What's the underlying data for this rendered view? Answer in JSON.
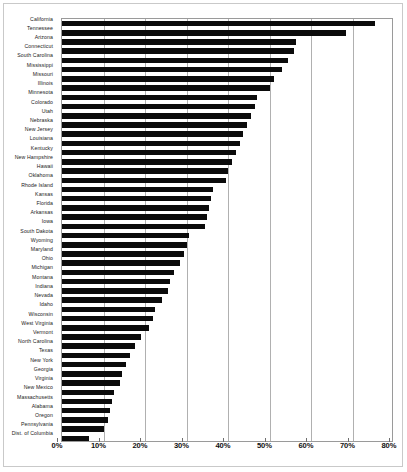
{
  "chart_data": {
    "type": "bar",
    "orientation": "horizontal",
    "title": "",
    "subtitle": "",
    "xlabel": "",
    "ylabel": "",
    "xlim": [
      0,
      80
    ],
    "xtick_labels": [
      "0%",
      "10%",
      "20%",
      "30%",
      "40%",
      "50%",
      "60%",
      "70%",
      "80%"
    ],
    "xtick_values": [
      0,
      10,
      20,
      30,
      40,
      50,
      60,
      70,
      80
    ],
    "grid": true,
    "legend": "none",
    "bar_color": "#0b0b0b",
    "categories": [
      "California",
      "Tennessee",
      "Arizona",
      "Connecticut",
      "South Carolina",
      "Mississippi",
      "Missouri",
      "Illinois",
      "Minnesota",
      "Colorado",
      "Utah",
      "Nebraska",
      "New Jersey",
      "Louisiana",
      "Kentucky",
      "New Hampshire",
      "Hawaii",
      "Oklahoma",
      "Rhode Island",
      "Kansas",
      "Florida",
      "Arkansas",
      "Iowa",
      "South Dakota",
      "Wyoming",
      "Maryland",
      "Ohio",
      "Michigan",
      "Montana",
      "Indiana",
      "Nevada",
      "Idaho",
      "Wisconsin",
      "West Virginia",
      "Vermont",
      "North Carolina",
      "Texas",
      "New York",
      "Georgia",
      "Virginia",
      "New Mexico",
      "Massachusetts",
      "Alabama",
      "Oregon",
      "Pennsylvania",
      "Dist. of Columbia"
    ],
    "values": [
      75.5,
      68.5,
      56.5,
      56.0,
      54.5,
      53.0,
      51.0,
      50.0,
      47.0,
      46.5,
      45.5,
      44.5,
      43.5,
      43.0,
      42.0,
      41.0,
      40.0,
      39.5,
      36.5,
      36.0,
      35.5,
      35.0,
      34.5,
      30.5,
      30.0,
      29.5,
      28.5,
      27.0,
      26.0,
      25.5,
      24.0,
      22.5,
      22.0,
      21.0,
      19.0,
      17.5,
      16.5,
      15.5,
      14.5,
      14.0,
      12.5,
      12.0,
      11.5,
      11.0,
      10.0,
      6.5
    ]
  }
}
